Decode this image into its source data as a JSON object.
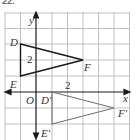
{
  "figure": {
    "top_label_partial": "22.",
    "grid": {
      "unit_px": 15.6,
      "origin_px": [
        36,
        92
      ],
      "x_range": [
        -2,
        6
      ],
      "y_range": [
        -3,
        5
      ],
      "line_color": "#b9b9b9",
      "axis_color": "#1a1a1a"
    },
    "axes": {
      "x_label": "x",
      "y_label": "y",
      "origin_label": "O"
    },
    "tick_labels": {
      "y_tick": "2",
      "x_tick": "2"
    },
    "original_triangle": {
      "color": "#1a1a1a",
      "vertices": [
        {
          "name": "D",
          "x": -1,
          "y": 3
        },
        {
          "name": "E",
          "x": -1,
          "y": 1
        },
        {
          "name": "F",
          "x": 3,
          "y": 2
        }
      ]
    },
    "image_triangle": {
      "color": "#777777",
      "vertices": [
        {
          "name": "D'",
          "x": 1,
          "y": 0
        },
        {
          "name": "E'",
          "x": 1,
          "y": -2
        },
        {
          "name": "F'",
          "x": 5,
          "y": -1
        }
      ]
    },
    "translation": [
      2,
      -3
    ]
  }
}
